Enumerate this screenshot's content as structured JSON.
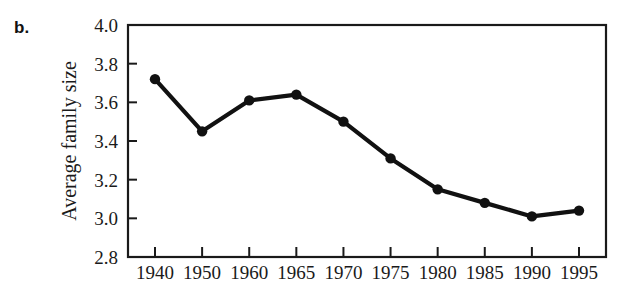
{
  "panel": {
    "label": "b."
  },
  "chart_data": {
    "type": "line",
    "title": "",
    "subtitle": "",
    "xlabel": "",
    "ylabel": "Average family size",
    "categories": [
      "1940",
      "1950",
      "1960",
      "1965",
      "1970",
      "1975",
      "1980",
      "1985",
      "1990",
      "1995"
    ],
    "x": [
      1940,
      1950,
      1960,
      1965,
      1970,
      1975,
      1980,
      1985,
      1990,
      1995
    ],
    "values": [
      3.72,
      3.45,
      3.61,
      3.64,
      3.5,
      3.31,
      3.15,
      3.08,
      3.01,
      3.04
    ],
    "series": [
      {
        "name": "Average family size",
        "values": [
          3.72,
          3.45,
          3.61,
          3.64,
          3.5,
          3.31,
          3.15,
          3.08,
          3.01,
          3.04
        ]
      }
    ],
    "ylim": [
      2.8,
      4.0
    ],
    "yticks": [
      2.8,
      3.0,
      3.2,
      3.4,
      3.6,
      3.8,
      4.0
    ],
    "ytick_labels": [
      "2.8",
      "3.0",
      "3.2",
      "3.4",
      "3.6",
      "3.8",
      "4.0"
    ],
    "xtick_labels": [
      "1940",
      "1950",
      "1960",
      "1965",
      "1970",
      "1975",
      "1980",
      "1985",
      "1990",
      "1995"
    ],
    "grid": false,
    "legend": false,
    "legend_position": "none",
    "marker": "filled-circle",
    "line_color": "#111111",
    "marker_color": "#111111",
    "axis_color": "#1a1a1a",
    "background_color": "#ffffff"
  }
}
